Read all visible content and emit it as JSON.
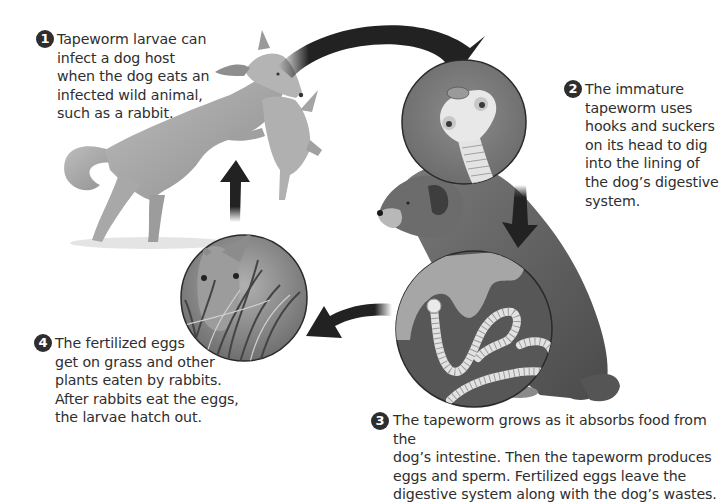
{
  "steps": [
    {
      "number": "1",
      "text": "Tapeworm larvae can\ninfect a dog host\nwhen the dog eats an\ninfected wild animal,\nsuch as a rabbit."
    },
    {
      "number": "2",
      "text": "The immature\ntapeworm uses\nhooks and suckers\non its head to dig\ninto the lining of\nthe dog’s digestive\nsystem."
    },
    {
      "number": "3",
      "text": "The tapeworm grows as it absorbs food from the\ndog’s intestine. Then the tapeworm produces\neggs and sperm. Fertilized eggs leave the\ndigestive system along with the dog’s wastes."
    },
    {
      "number": "4",
      "text": "The fertilized eggs\nget on grass and other\nplants eaten by rabbits.\nAfter rabbits eat the eggs,\nthe larvae hatch out."
    }
  ],
  "illustrations": {
    "leaping_dog": "dog leaping with rabbit in mouth",
    "sitting_dog": "sitting dog",
    "magnified_head": "tapeworm head with hooks and suckers",
    "magnified_intestine": "tapeworm in intestine lining",
    "rabbit_grass": "rabbit eating grass"
  },
  "colors": {
    "text": "#2e2e2e",
    "arrow": "#222222",
    "circle_bg_head": "#7d7d7d",
    "circle_bg_intestine": "#555555",
    "worm": "#e6e6e6"
  }
}
